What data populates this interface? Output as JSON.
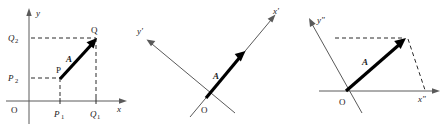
{
  "figure": {
    "panels": [
      {
        "id": "cartesian",
        "name": "rectangular-cartesian-axes",
        "axes": [
          {
            "label": "x",
            "name": "x-axis"
          },
          {
            "label": "y",
            "name": "y-axis"
          }
        ],
        "origin_label": "O",
        "vector_label": "A",
        "points": [
          {
            "label": "P",
            "name": "point-p"
          },
          {
            "label": "Q",
            "name": "point-q"
          }
        ],
        "tick_labels": [
          {
            "label": "P",
            "sub": "1",
            "name": "tick-p1",
            "axis": "x"
          },
          {
            "label": "Q",
            "sub": "1",
            "name": "tick-q1",
            "axis": "x"
          },
          {
            "label": "P",
            "sub": "2",
            "name": "tick-p2",
            "axis": "y"
          },
          {
            "label": "Q",
            "sub": "2",
            "name": "tick-q2",
            "axis": "y"
          }
        ]
      },
      {
        "id": "rotated",
        "name": "rotated-cartesian-axes",
        "axes": [
          {
            "label": "x'",
            "name": "x-prime-axis"
          },
          {
            "label": "y'",
            "name": "y-prime-axis"
          }
        ],
        "origin_label": "O",
        "vector_label": "A"
      },
      {
        "id": "oblique",
        "name": "oblique-axes",
        "axes": [
          {
            "label": "x\"",
            "name": "x-double-prime-axis"
          },
          {
            "label": "y\"",
            "name": "y-double-prime-axis"
          }
        ],
        "origin_label": "O",
        "vector_label": "A"
      }
    ],
    "colors": {
      "background": "#ffffff",
      "axis": "#5a5a5a",
      "vector": "#000000",
      "dashed": "#2b2b2b",
      "text": "#1a1a1a"
    }
  }
}
